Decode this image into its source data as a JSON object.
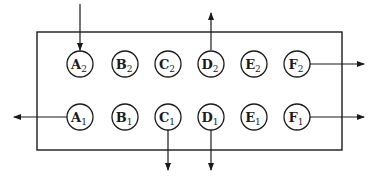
{
  "diagram": {
    "type": "block-flow",
    "container": {
      "x": 37,
      "y": 32,
      "width": 305,
      "height": 118
    },
    "stroke_color": "#1a1a1a",
    "nodes": [
      {
        "id": "A2",
        "letter": "A",
        "sub": "2",
        "cx": 80,
        "cy": 64
      },
      {
        "id": "B2",
        "letter": "B",
        "sub": "2",
        "cx": 125,
        "cy": 64
      },
      {
        "id": "C2",
        "letter": "C",
        "sub": "2",
        "cx": 168,
        "cy": 64
      },
      {
        "id": "D2",
        "letter": "D",
        "sub": "2",
        "cx": 211,
        "cy": 64
      },
      {
        "id": "E2",
        "letter": "E",
        "sub": "2",
        "cx": 254,
        "cy": 64
      },
      {
        "id": "F2",
        "letter": "F",
        "sub": "2",
        "cx": 297,
        "cy": 64
      },
      {
        "id": "A1",
        "letter": "A",
        "sub": "1",
        "cx": 80,
        "cy": 117
      },
      {
        "id": "B1",
        "letter": "B",
        "sub": "1",
        "cx": 125,
        "cy": 117
      },
      {
        "id": "C1",
        "letter": "C",
        "sub": "1",
        "cx": 168,
        "cy": 117
      },
      {
        "id": "D1",
        "letter": "D",
        "sub": "1",
        "cx": 211,
        "cy": 117
      },
      {
        "id": "E1",
        "letter": "E",
        "sub": "1",
        "cx": 254,
        "cy": 117
      },
      {
        "id": "F1",
        "letter": "F",
        "sub": "1",
        "cx": 297,
        "cy": 117
      }
    ],
    "node_radius": 13,
    "arrows": [
      {
        "name": "arrow-into-A2",
        "direction": "in-from-top",
        "x1": 80,
        "y1": 4,
        "x2": 80,
        "y2": 50
      },
      {
        "name": "arrow-out-D2",
        "direction": "out-up",
        "x1": 211,
        "y1": 50,
        "x2": 211,
        "y2": 13
      },
      {
        "name": "arrow-out-F2",
        "direction": "out-right",
        "x1": 310,
        "y1": 64,
        "x2": 364,
        "y2": 64
      },
      {
        "name": "arrow-out-A1",
        "direction": "out-left",
        "x1": 67,
        "y1": 117,
        "x2": 14,
        "y2": 117
      },
      {
        "name": "arrow-out-C1",
        "direction": "out-down",
        "x1": 168,
        "y1": 130,
        "x2": 168,
        "y2": 170
      },
      {
        "name": "arrow-out-D1",
        "direction": "out-down",
        "x1": 211,
        "y1": 130,
        "x2": 211,
        "y2": 170
      },
      {
        "name": "arrow-out-F1",
        "direction": "out-right",
        "x1": 310,
        "y1": 117,
        "x2": 364,
        "y2": 117
      }
    ]
  }
}
